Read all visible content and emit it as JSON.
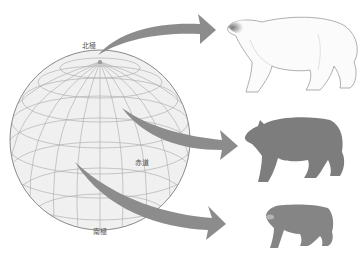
{
  "diagram": {
    "title": "",
    "labels": {
      "north_pole": "北極",
      "equator": "赤道",
      "south_pole": "南極"
    },
    "globe": {
      "fill": "#f0f0f0",
      "stroke": "#8a8a8a",
      "grid_color": "#a8a8a8"
    },
    "arrows": [
      {
        "from": "north_pole",
        "to": "polar_bear",
        "color": "#8c8c8c"
      },
      {
        "from": "mid_latitude",
        "to": "black_bear",
        "color": "#8c8c8c"
      },
      {
        "from": "equator",
        "to": "sun_bear",
        "color": "#8c8c8c"
      }
    ],
    "animals": [
      {
        "name": "polar-bear",
        "size": "large",
        "fill": "#fbfbfb",
        "stroke": "#9a9a9a"
      },
      {
        "name": "black-bear",
        "size": "medium",
        "fill": "#7d7d7d"
      },
      {
        "name": "sun-bear",
        "size": "small",
        "fill": "#858585"
      }
    ]
  }
}
